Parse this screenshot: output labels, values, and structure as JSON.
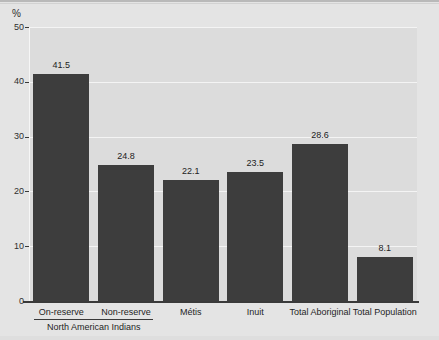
{
  "chart_data": {
    "type": "bar",
    "title": "",
    "xlabel": "",
    "ylabel": "%",
    "ylim": [
      0,
      50
    ],
    "yticks": [
      0,
      10,
      20,
      30,
      40,
      50
    ],
    "ytick_labels": [
      "0",
      "10",
      "20",
      "30",
      "40",
      "50"
    ],
    "grid": true,
    "legend": false,
    "categories": [
      "On-reserve",
      "Non-reserve",
      "Métis",
      "Inuit",
      "Total Aboriginal",
      "Total Population"
    ],
    "values": [
      41.5,
      24.8,
      22.1,
      23.5,
      28.6,
      8.1
    ],
    "value_labels": [
      "41.5",
      "24.8",
      "22.1",
      "23.5",
      "28.6",
      "8.1"
    ],
    "annotations": [
      {
        "text": "North American Indians",
        "spans_categories": [
          "On-reserve",
          "Non-reserve"
        ]
      }
    ],
    "colors": {
      "bar": "#3d3d3d",
      "plot_background": "#dcdcdc",
      "figure_background": "#e4e4e4",
      "gridline": "#f4f4f4",
      "axis": "#3a3a3a",
      "text": "#1f1f1f"
    }
  }
}
